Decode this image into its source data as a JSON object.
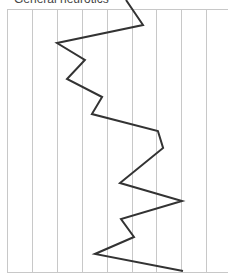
{
  "chart_data": {
    "type": "line",
    "orientation": "vertical-profile",
    "title": "General neurotics",
    "xlabel": "",
    "ylabel": "",
    "x_gridlines": 9,
    "xlim": [
      0,
      8
    ],
    "grid": true,
    "legend": null,
    "series": [
      {
        "name": "General neurotics",
        "color": "#333333",
        "values": [
          4.78,
          5.46,
          2.01,
          3.13,
          2.41,
          3.82,
          3.41,
          6.06,
          6.27,
          4.54,
          7.03,
          4.58,
          5.1,
          3.53,
          7.07
        ],
        "row_y": [
          0,
          25,
          43,
          60,
          79,
          97,
          114,
          131,
          148,
          183,
          201,
          219,
          237,
          254,
          271
        ]
      }
    ]
  },
  "colors": {
    "grid": "#c8c8c8",
    "line": "#333333",
    "title": "#444444"
  }
}
